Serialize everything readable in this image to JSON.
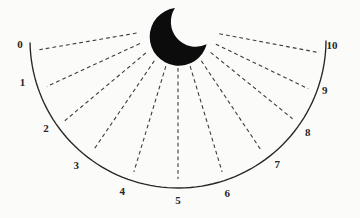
{
  "figure": {
    "type": "semicircular-rating-scale",
    "icon": "crescent-moon-icon",
    "background_color": "#fbfbf9",
    "ink_color": "#262626",
    "moon_color": "#0c0c0c",
    "ray_color": "#3d3d3d"
  },
  "scale": {
    "labels": [
      "0",
      "1",
      "2",
      "3",
      "4",
      "5",
      "6",
      "7",
      "8",
      "9",
      "10"
    ]
  }
}
